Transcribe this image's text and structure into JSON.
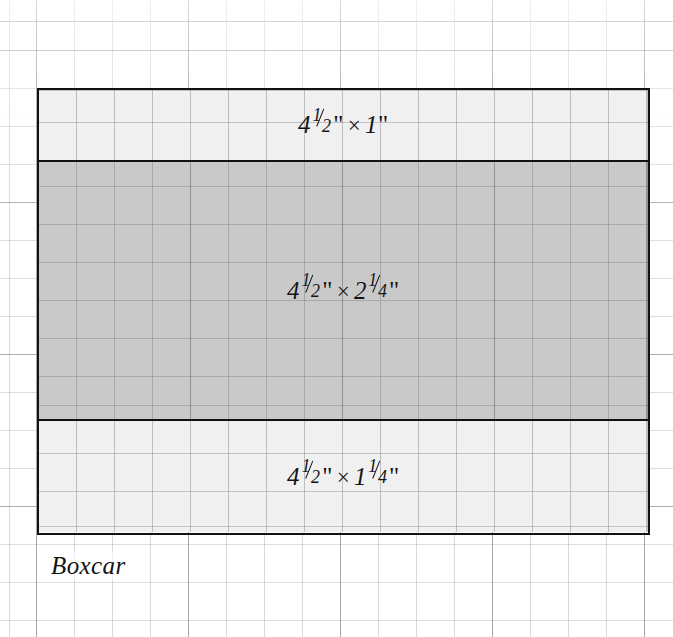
{
  "figure": {
    "caption": "Boxcar",
    "background": "graph-paper",
    "outline_color": "#111111",
    "grid_minor_spacing_px": 38,
    "grid_major_spacing_px": 152
  },
  "bands": [
    {
      "id": "roof-band",
      "name": "top-band",
      "label": "4 1/2\" × 1\"",
      "width_text": "4",
      "width_fraction_num": "1",
      "width_fraction_den": "2",
      "height_text": "1",
      "height_fraction_num": "",
      "height_fraction_den": "",
      "fill": "#f0f0f0",
      "width_inches": "4 1/2",
      "height_inches": "1"
    },
    {
      "id": "body-band",
      "name": "middle-band",
      "label": "4 1/2\" × 2 1/4\"",
      "width_text": "4",
      "width_fraction_num": "1",
      "width_fraction_den": "2",
      "height_text": "2",
      "height_fraction_num": "1",
      "height_fraction_den": "4",
      "fill": "#c9c9c9",
      "width_inches": "4 1/2",
      "height_inches": "2 1/4"
    },
    {
      "id": "underframe-band",
      "name": "bottom-band",
      "label": "4 1/2\" × 1 1/4\"",
      "width_text": "4",
      "width_fraction_num": "1",
      "width_fraction_den": "2",
      "height_text": "1",
      "height_fraction_num": "1",
      "height_fraction_den": "4",
      "fill": "#f0f0f0",
      "width_inches": "4 1/2",
      "height_inches": "1 1/4"
    }
  ],
  "symbols": {
    "times": "×",
    "inch_mark": "\""
  }
}
